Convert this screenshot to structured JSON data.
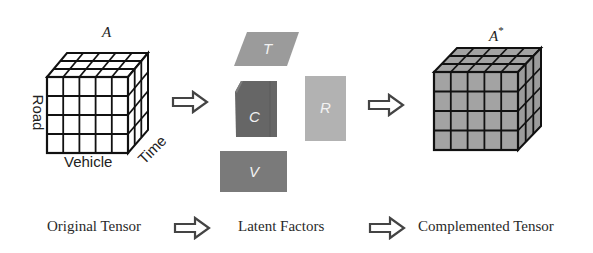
{
  "diagram": {
    "type": "tensor-completion-flow",
    "original_tensor": {
      "symbol": "A",
      "axes": {
        "road": "Road",
        "vehicle": "Vehicle",
        "time": "Time"
      },
      "grid": {
        "rows": 4,
        "cols": 5,
        "depth": 3
      },
      "fill_color": "#ffffff"
    },
    "latent_factors": [
      {
        "id": "T",
        "label": "T",
        "shape": "parallelogram",
        "color": "#9b9b9b"
      },
      {
        "id": "C",
        "label": "C",
        "shape": "cube-slab",
        "color": "#666666"
      },
      {
        "id": "R",
        "label": "R",
        "shape": "rectangle",
        "color": "#b2b2b2"
      },
      {
        "id": "V",
        "label": "V",
        "shape": "rectangle",
        "color": "#7a7a7a"
      }
    ],
    "complemented_tensor": {
      "symbol": "A",
      "superscript": "*",
      "grid": {
        "rows": 4,
        "cols": 5,
        "depth": 3
      },
      "fill_color": "#a3a3a3"
    },
    "captions": {
      "original": "Original Tensor",
      "latent": "Latent Factors",
      "complemented": "Complemented Tensor"
    },
    "arrow_icon": "hollow-right-arrow"
  }
}
